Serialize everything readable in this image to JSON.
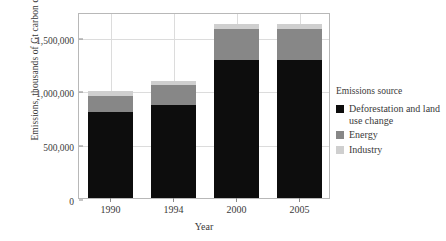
{
  "chart_data": {
    "type": "bar",
    "stacked": true,
    "title": "",
    "xlabel": "Year",
    "ylabel": "Emissions, thousands of Gt carbon dioxide",
    "categories": [
      "1990",
      "1994",
      "2000",
      "2005"
    ],
    "series": [
      {
        "name": "Deforestation and land use change",
        "color": "#0d0d0d",
        "values": [
          803000,
          869000,
          1280000,
          1280000
        ]
      },
      {
        "name": "Energy",
        "color": "#878787",
        "values": [
          150000,
          178000,
          290000,
          290000
        ]
      },
      {
        "name": "Industry",
        "color": "#cfcfcf",
        "values": [
          47000,
          37000,
          47000,
          47000
        ]
      }
    ],
    "totals": [
      1000000,
      1084000,
      1617000,
      1617000
    ],
    "ylim": [
      0,
      1730000
    ],
    "yticks": [
      0,
      500000,
      1000000,
      1500000
    ],
    "ytick_labels": [
      "0",
      "500,000",
      "1,000,000",
      "1,500,000"
    ],
    "grid": true,
    "grid_axis": "both",
    "legend_position": "right",
    "legend_title": "Emissions source",
    "panel_border_color": "#b8b8b8",
    "gridline_color": "#dcdcdc",
    "text_color": "#3a3a3a"
  }
}
